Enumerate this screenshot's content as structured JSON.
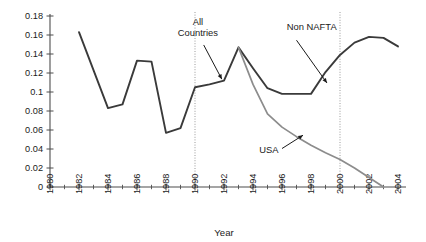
{
  "chart_data": {
    "type": "line",
    "title": "",
    "subtitle": "",
    "xlabel": "Year",
    "ylabel": "",
    "xlim": [
      1980,
      2004
    ],
    "ylim": [
      0,
      0.18
    ],
    "grid": false,
    "legend": "none (inline annotations with arrows)",
    "x_tick_labels": [
      "1980",
      "1982",
      "1984",
      "1986",
      "1988",
      "1990",
      "1992",
      "1994",
      "1996",
      "1998",
      "2000",
      "2002",
      "2004"
    ],
    "x_tick_values": [
      1980,
      1982,
      1984,
      1986,
      1988,
      1990,
      1992,
      1994,
      1996,
      1998,
      2000,
      2002,
      2004
    ],
    "x_minor_ticks": [
      1981,
      1983,
      1985,
      1987,
      1989,
      1991,
      1993,
      1995,
      1997,
      1999,
      2001,
      2003
    ],
    "y_tick_labels": [
      "0",
      "0.02",
      "0.04",
      "0.06",
      "0.08",
      "0.1",
      "0.12",
      "0.14",
      "0.16",
      "0.18"
    ],
    "y_tick_values": [
      0,
      0.02,
      0.04,
      0.06,
      0.08,
      0.1,
      0.12,
      0.14,
      0.16,
      0.18
    ],
    "reference_lines": [
      {
        "name": "vline-1990",
        "x": 1990,
        "style": "dotted",
        "color": "#9a9a9a"
      },
      {
        "name": "vline-2000",
        "x": 2000,
        "style": "dotted",
        "color": "#9a9a9a"
      }
    ],
    "series": [
      {
        "name": "All Countries / Non NAFTA",
        "color": "#3a3a3a",
        "width": 1.9,
        "x": [
          1982,
          1983,
          1984,
          1985,
          1986,
          1987,
          1988,
          1989,
          1990,
          1991,
          1992,
          1993,
          1994,
          1995,
          1996,
          1997,
          1998,
          1999,
          2000,
          2001,
          2002,
          2003,
          2004
        ],
        "values": [
          0.163,
          0.123,
          0.083,
          0.087,
          0.133,
          0.132,
          0.057,
          0.062,
          0.105,
          0.108,
          0.112,
          0.147,
          0.125,
          0.104,
          0.098,
          0.098,
          0.098,
          0.121,
          0.139,
          0.152,
          0.158,
          0.157,
          0.148
        ]
      },
      {
        "name": "USA",
        "color": "#8c8c8c",
        "width": 1.7,
        "x": [
          1993,
          1994,
          1995,
          1996,
          1997,
          1998,
          1999,
          2000,
          2001,
          2002,
          2003
        ],
        "values": [
          0.147,
          0.108,
          0.077,
          0.063,
          0.053,
          0.044,
          0.036,
          0.029,
          0.02,
          0.01,
          0.0
        ]
      }
    ],
    "annotations": [
      {
        "name": "all-countries",
        "text_lines": [
          "All",
          "Countries"
        ],
        "label_x": 1990.2,
        "label_y": 0.1705,
        "arrow_from_x": 1990.6,
        "arrow_from_y": 0.1495,
        "arrow_to_x": 1991.85,
        "arrow_to_y": 0.1135
      },
      {
        "name": "non-nafta",
        "text_lines": [
          "Non NAFTA"
        ],
        "label_x": 1998.05,
        "label_y": 0.1655,
        "arrow_from_x": 1997.0,
        "arrow_from_y": 0.1545,
        "arrow_to_x": 1999.1,
        "arrow_to_y": 0.1095
      },
      {
        "name": "usa",
        "text_lines": [
          "USA"
        ],
        "label_x": 1995.1,
        "label_y": 0.0355,
        "arrow_from_x": 1996.0,
        "arrow_from_y": 0.0405,
        "arrow_to_x": 1997.45,
        "arrow_to_y": 0.0545
      }
    ]
  },
  "axis": {
    "x_title": "Year"
  },
  "colors": {
    "axis": "#4d4d4d",
    "series_dark": "#3a3a3a",
    "series_gray": "#8c8c8c",
    "reference": "#9a9a9a",
    "text": "#1a1a1a",
    "background": "#ffffff"
  }
}
